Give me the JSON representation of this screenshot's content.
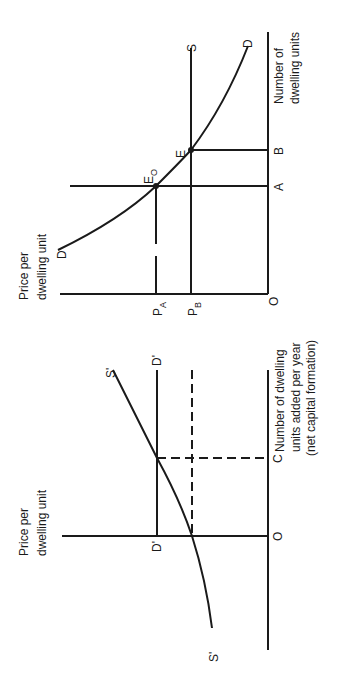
{
  "panel_a": {
    "y_axis_title_line1": "Price per",
    "y_axis_title_line2": "dwelling unit",
    "x_axis_title_line1": "Number of",
    "x_axis_title_line2": "dwelling units",
    "origin": "O",
    "demand_label_start": "D",
    "demand_label_end": "D",
    "supply_label": "S",
    "price_a_main": "P",
    "price_a_sub": "A",
    "price_b_main": "P",
    "price_b_sub": "B",
    "point_e0_main": "E",
    "point_e0_sub": "O",
    "point_e": "E",
    "qty_a": "A",
    "qty_b": "B"
  },
  "panel_b": {
    "y_axis_title_line1": "Price per",
    "y_axis_title_line2": "dwelling unit",
    "x_axis_title_line1": "Number of dwelling",
    "x_axis_title_line2": "units added per year",
    "x_axis_title_line3": "(net capital formation)",
    "origin": "O",
    "qty_c": "C",
    "supply_label_start": "S'",
    "supply_label_end": "S'",
    "demand_label_start": "D'",
    "demand_label_end": "D'"
  }
}
